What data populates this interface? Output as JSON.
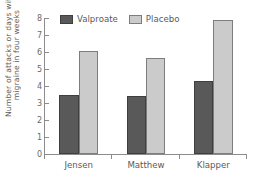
{
  "chart_data": {
    "type": "bar",
    "title": "",
    "subtitle": "",
    "xlabel": "",
    "ylabel_lines": [
      "Number of attacks or days with",
      "migraine in four weeks"
    ],
    "ylabel": "Number of attacks or days with migraine in four weeks",
    "categories": [
      "Jensen",
      "Matthew",
      "Klapper"
    ],
    "series": [
      {
        "name": "Valproate",
        "color": "#595959",
        "border_color": "#3f3f3f",
        "values": [
          3.45,
          3.4,
          4.3
        ]
      },
      {
        "name": "Placebo",
        "color": "#cbcbcb",
        "border_color": "#7d7d7d",
        "values": [
          6.05,
          5.65,
          7.9
        ]
      }
    ],
    "ylim": [
      0,
      8
    ],
    "ytick_step": 1,
    "yticks": [
      0,
      1,
      2,
      3,
      4,
      5,
      6,
      7,
      8
    ],
    "ytick_labels": [
      "0",
      "1",
      "2",
      "3",
      "4",
      "5",
      "6",
      "7",
      "8"
    ],
    "grid": false,
    "legend_position": "top-left-inside",
    "axis_color": "#8c8c8c",
    "text_color": "#5a5a5a",
    "background": "#ffffff",
    "annotations": []
  },
  "legend": {
    "entries": [
      {
        "label": "Valproate"
      },
      {
        "label": "Placebo"
      }
    ]
  }
}
